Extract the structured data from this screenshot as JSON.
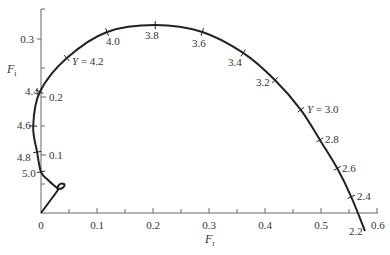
{
  "chart_data": {
    "type": "line",
    "title": "",
    "xlabel": "F_r",
    "ylabel": "F_i",
    "xlabel_main": "F",
    "xlabel_sub": "r",
    "ylabel_main": "F",
    "ylabel_sub": "i",
    "xlim": [
      0,
      0.6
    ],
    "ylim": [
      0,
      0.33
    ],
    "grid": false,
    "legend": null,
    "x_ticks": [
      {
        "value": 0,
        "label": "0"
      },
      {
        "value": 0.1,
        "label": "0.1"
      },
      {
        "value": 0.2,
        "label": "0.2"
      },
      {
        "value": 0.3,
        "label": "0.3"
      },
      {
        "value": 0.4,
        "label": "0.4"
      },
      {
        "value": 0.5,
        "label": "0.5"
      },
      {
        "value": 0.6,
        "label": "0.6"
      }
    ],
    "x_minor_ticks": [
      0.05,
      0.15,
      0.25,
      0.35,
      0.45,
      0.55
    ],
    "y_ticks": [
      {
        "value": 0.1,
        "label": "0.1"
      },
      {
        "value": 0.2,
        "label": "0.2"
      },
      {
        "value": 0.3,
        "label": "0.3"
      }
    ],
    "y_minor_ticks": [
      0.05,
      0.15,
      0.25
    ],
    "curve": {
      "name": "F(Y) locus",
      "parameter": "Y",
      "points": [
        {
          "Y": 2.2,
          "Fr": 0.58,
          "Fi": -0.03,
          "label": "2.2"
        },
        {
          "Y": 2.4,
          "Fr": 0.554,
          "Fi": 0.028,
          "label": "2.4"
        },
        {
          "Y": 2.6,
          "Fr": 0.529,
          "Fi": 0.077,
          "label": "2.6"
        },
        {
          "Y": 2.8,
          "Fr": 0.498,
          "Fi": 0.126,
          "label": "2.8"
        },
        {
          "Y": 3.0,
          "Fr": 0.464,
          "Fi": 0.178,
          "label": "Y = 3.0"
        },
        {
          "Y": 3.2,
          "Fr": 0.418,
          "Fi": 0.229,
          "label": "3.2"
        },
        {
          "Y": 3.4,
          "Fr": 0.361,
          "Fi": 0.276,
          "label": "3.4"
        },
        {
          "Y": 3.6,
          "Fr": 0.288,
          "Fi": 0.312,
          "label": "3.6"
        },
        {
          "Y": 3.8,
          "Fr": 0.204,
          "Fi": 0.324,
          "label": "3.8"
        },
        {
          "Y": 4.0,
          "Fr": 0.118,
          "Fi": 0.312,
          "label": "4.0"
        },
        {
          "Y": 4.2,
          "Fr": 0.046,
          "Fi": 0.267,
          "label": "Y = 4.2"
        },
        {
          "Y": 4.4,
          "Fr": -0.002,
          "Fi": 0.209,
          "label": "4.4"
        },
        {
          "Y": 4.6,
          "Fr": -0.014,
          "Fi": 0.15,
          "label": "4.6"
        },
        {
          "Y": 4.8,
          "Fr": -0.007,
          "Fi": 0.105,
          "label": "4.8"
        },
        {
          "Y": 5.0,
          "Fr": 0.0,
          "Fi": 0.071,
          "label": "5.0"
        }
      ],
      "end_behavior": "spirals into small loop near (0.045, 0.04) then straight segment to origin"
    }
  }
}
